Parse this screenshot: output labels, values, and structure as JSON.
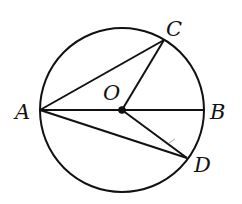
{
  "diagram": {
    "circle": {
      "cx": 122,
      "cy": 110,
      "r": 82,
      "stroke": "#111111"
    },
    "points": {
      "A": {
        "x": 40,
        "y": 110,
        "label": "A"
      },
      "B": {
        "x": 204,
        "y": 110,
        "label": "B"
      },
      "C": {
        "x": 164,
        "y": 40,
        "label": "C"
      },
      "D": {
        "x": 187,
        "y": 158,
        "label": "D"
      },
      "O": {
        "x": 122,
        "y": 110,
        "label": "O"
      }
    },
    "segments": [
      {
        "from": "A",
        "to": "B",
        "name": "diameter-AB"
      },
      {
        "from": "A",
        "to": "C",
        "name": "chord-AC"
      },
      {
        "from": "O",
        "to": "C",
        "name": "radius-OC"
      },
      {
        "from": "A",
        "to": "D",
        "name": "chord-AD"
      },
      {
        "from": "O",
        "to": "D",
        "name": "radius-OD"
      }
    ],
    "labels": {
      "A": "A",
      "B": "B",
      "C": "C",
      "D": "D",
      "O": "O"
    }
  }
}
